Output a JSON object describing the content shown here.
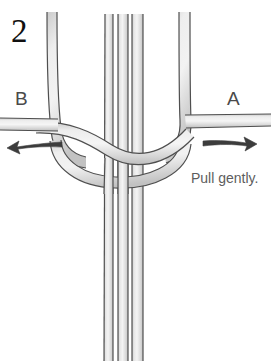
{
  "figure": {
    "kind": "instructional-knot-diagram",
    "step_number": "2",
    "background_color": "#ffffff",
    "cord_fill_color": "#dcdcdc",
    "cord_highlight_color": "#f2f2f2",
    "cord_outline_color": "#4f4f4f",
    "arrow_color": "#3c3c3c",
    "text_color": "#4a4a4a",
    "step_number_color": "#111111"
  },
  "labels": {
    "step": "2",
    "left_cord": "B",
    "right_cord": "A",
    "instruction": "Pull gently."
  },
  "arrows": [
    {
      "name": "left-arrow",
      "direction": "left",
      "meaning": "pull cord B to the left"
    },
    {
      "name": "right-arrow",
      "direction": "right",
      "meaning": "pull cord A to the right"
    }
  ],
  "cords": {
    "vertical_bundle_count": 3,
    "working_cord_count": 2,
    "description": "A horizontal working cord pair crosses around a vertical bundle of cords forming a half-knot; ends A and B extend to the right and left."
  }
}
